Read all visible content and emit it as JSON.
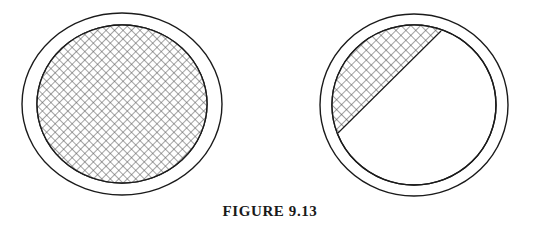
{
  "figure": {
    "caption": "FIGURE 9.13",
    "caption_prefix": "FIGURE",
    "caption_number": "9.13",
    "background_color": "#ffffff",
    "line_color": "#1a1a1a",
    "hatch_color": "#555555",
    "panels": [
      {
        "id": "left",
        "name": "fully-hatched-annulus",
        "description": "Circle with double outline ring, interior completely cross-hatched",
        "center_x": 122,
        "center_y": 104,
        "outer_rx": 100,
        "outer_ry": 91,
        "inner_rx": 85,
        "inner_ry": 79,
        "hatch_coverage": "full",
        "hatch_angle_deg": 45,
        "hatch_spacing_px": 6
      },
      {
        "id": "right",
        "name": "segment-hatched-annulus",
        "description": "Circle with double outline ring, interior cross-hatched only in the upper-left circular segment bounded by a diagonal chord",
        "center_x": 414,
        "center_y": 105,
        "outer_rx": 94,
        "outer_ry": 91,
        "inner_rx": 82,
        "inner_ry": 80,
        "hatch_coverage": "upper-left-segment",
        "hatch_angle_deg": 45,
        "hatch_spacing_px": 7,
        "chord_start_x": 338,
        "chord_start_y": 133,
        "chord_end_x": 441,
        "chord_end_y": 31
      }
    ]
  }
}
